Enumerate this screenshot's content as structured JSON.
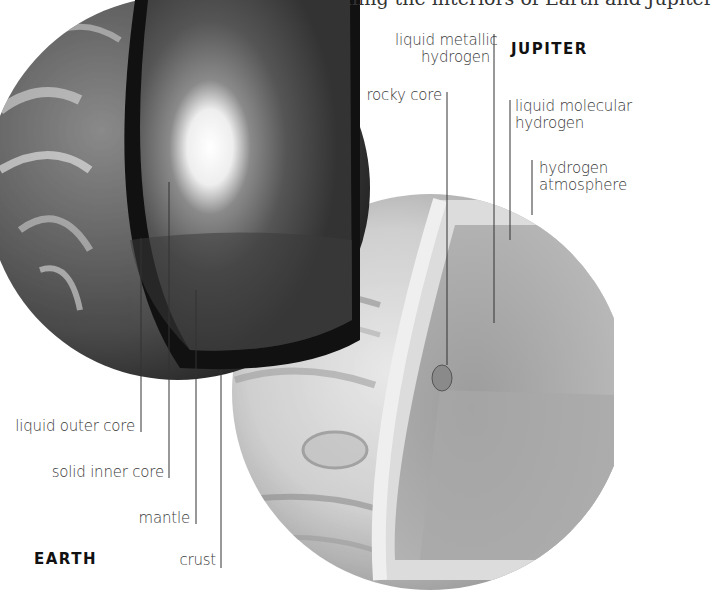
{
  "caption_fragment": "ishing the interiors of Earth and Jupiter",
  "earth": {
    "title": "EARTH",
    "labels": [
      {
        "id": "liquid-outer-core",
        "text": "liquid outer core"
      },
      {
        "id": "solid-inner-core",
        "text": "solid inner core"
      },
      {
        "id": "mantle",
        "text": "mantle"
      },
      {
        "id": "crust",
        "text": "crust"
      }
    ]
  },
  "jupiter": {
    "title": "JUPITER",
    "labels": [
      {
        "id": "liquid-metallic-hydrogen",
        "line1": "liquid metallic",
        "line2": "hydrogen"
      },
      {
        "id": "rocky-core",
        "text": "rocky core"
      },
      {
        "id": "liquid-molecular-hydrogen",
        "line1": "liquid molecular",
        "line2": "hydrogen"
      },
      {
        "id": "hydrogen-atmosphere",
        "line1": "hydrogen",
        "line2": "atmosphere"
      }
    ]
  }
}
